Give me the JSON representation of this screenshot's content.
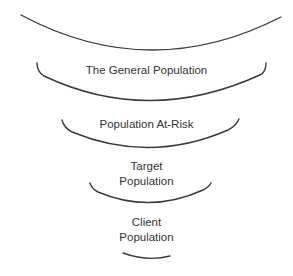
{
  "diagram": {
    "type": "funnel",
    "levels": [
      {
        "label": ""
      },
      {
        "label": "The General Population"
      },
      {
        "label": "Population At-Risk"
      },
      {
        "label": "Target\nPopulation"
      },
      {
        "label": "Client\nPopulation"
      }
    ],
    "colors": {
      "stroke": "#3a3a3a",
      "text": "#333333",
      "background": "#ffffff"
    }
  }
}
